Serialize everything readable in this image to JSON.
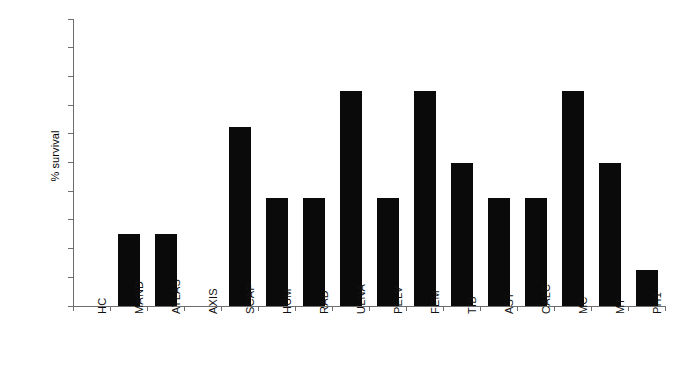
{
  "chart_data": {
    "type": "bar",
    "title": "",
    "xlabel": "",
    "ylabel": "% survival",
    "ylim": [
      0,
      100
    ],
    "ytick_values": [
      0,
      10,
      20,
      30,
      40,
      50,
      60,
      70,
      80,
      90,
      100
    ],
    "ytick_labels": [
      "0",
      "10",
      "20",
      "30",
      "40",
      "50",
      "60",
      "70",
      "80",
      "90",
      "100"
    ],
    "grid": false,
    "legend": null,
    "bar_color": "#0a0a0a",
    "axis_color": "#6e6e6e",
    "categories": [
      "HC",
      "MAND",
      "ATLAS",
      "AXIS",
      "SCAP",
      "HUM",
      "RAD",
      "ULNA",
      "PELV",
      "FEM",
      "TIB",
      "AST",
      "CALC",
      "MC",
      "MT",
      "PH1"
    ],
    "values": [
      0,
      25,
      25,
      0,
      62.5,
      37.5,
      37.5,
      75,
      37.5,
      75,
      50,
      37.5,
      37.5,
      75,
      50,
      12.5
    ]
  }
}
